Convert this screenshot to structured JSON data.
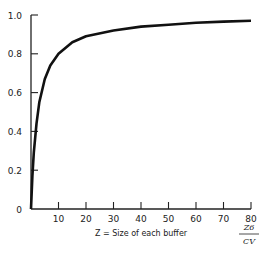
{
  "chart_data": {
    "type": "line",
    "title": "",
    "xlabel": "Z = Size of each buffer",
    "xlabel_right": {
      "numerator": "Z6",
      "denominator": "CV"
    },
    "ylabel": "",
    "xlim": [
      0,
      80
    ],
    "ylim": [
      0,
      1.0
    ],
    "grid": false,
    "x_ticks": [
      10,
      20,
      30,
      40,
      50,
      60,
      70,
      80
    ],
    "y_ticks": [
      0,
      0.2,
      0.4,
      0.6,
      0.8,
      1.0
    ],
    "y_tick_labels": [
      "0",
      "0.2",
      "0.4",
      "0.6",
      "0.8",
      "1.0"
    ],
    "x_tick_labels": [
      "10",
      "20",
      "30",
      "40",
      "50",
      "60",
      "70",
      "80"
    ],
    "series": [
      {
        "name": "curve",
        "x": [
          0,
          0.5,
          1,
          2,
          3,
          5,
          7,
          10,
          15,
          20,
          30,
          40,
          50,
          60,
          70,
          80
        ],
        "y": [
          0,
          0.17,
          0.29,
          0.44,
          0.55,
          0.67,
          0.74,
          0.8,
          0.86,
          0.89,
          0.92,
          0.94,
          0.95,
          0.96,
          0.966,
          0.97
        ]
      }
    ]
  }
}
